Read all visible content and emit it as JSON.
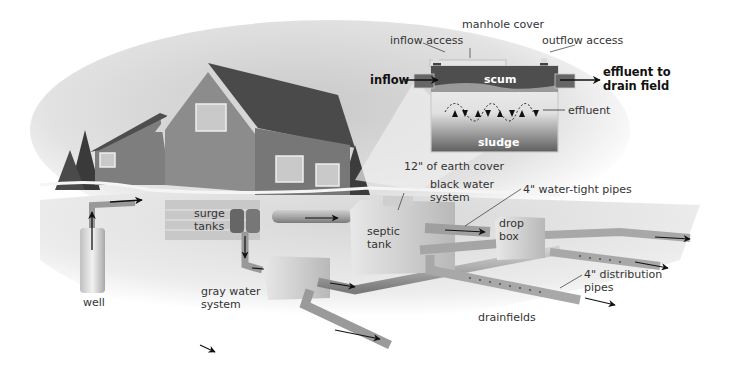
{
  "diagram": {
    "tank_detail": {
      "labels": {
        "manhole_cover": "manhole cover",
        "inflow_access": "inflow access",
        "outflow_access": "outflow access",
        "inflow": "inflow",
        "effluent_to_drain_field_line1": "effluent to",
        "effluent_to_drain_field_line2": "drain field",
        "scum": "scum",
        "effluent": "effluent",
        "sludge": "sludge"
      }
    },
    "system_labels": {
      "earth_cover": "12\" of earth cover",
      "black_water_line1": "black water",
      "black_water_line2": "system",
      "water_tight_pipes": "4\" water-tight pipes",
      "surge_line1": "surge",
      "surge_line2": "tanks",
      "septic_line1": "septic",
      "septic_line2": "tank",
      "drop_line1": "drop",
      "drop_line2": "box",
      "distribution_line1": "4\" distribution",
      "distribution_line2": "pipes",
      "gray_line1": "gray water",
      "gray_line2": "system",
      "drainfields": "drainfields",
      "well": "well"
    },
    "colors": {
      "sky": "#d8d8d8",
      "ground": "#e6e6e6",
      "house_wall": "#8a8a8a",
      "roof": "#555555",
      "pipe": "#a9a9a9",
      "tank_fill": "#d4d4d4",
      "tank_dark": "#5a5a5a",
      "arrow": "#111111"
    }
  }
}
